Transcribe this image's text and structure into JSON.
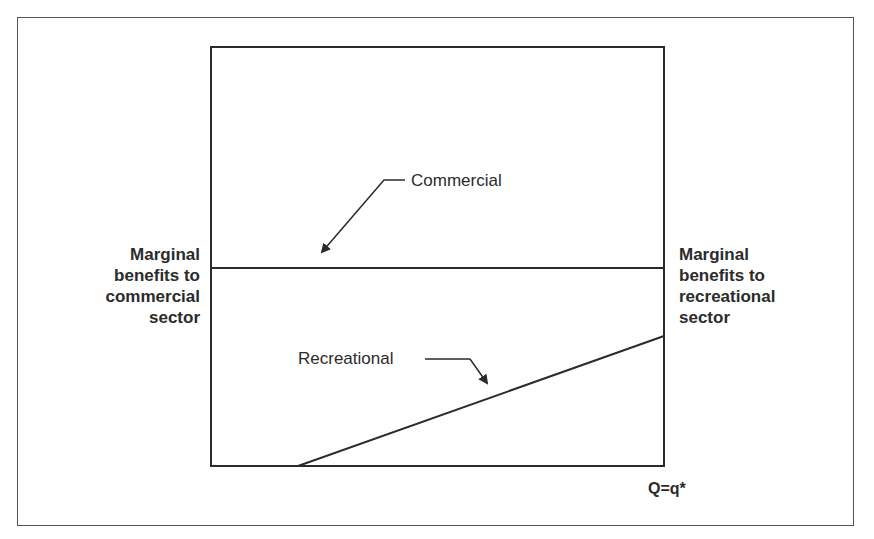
{
  "diagram": {
    "left_axis_label": [
      "Marginal",
      "benefits to",
      "commercial",
      "sector"
    ],
    "right_axis_label": [
      "Marginal",
      "benefits to",
      "recreational",
      "sector"
    ],
    "x_axis_label": "Q=q*",
    "curves": [
      {
        "name": "Commercial",
        "shape": "horizontal",
        "level": 0.53
      },
      {
        "name": "Recreational",
        "shape": "rising",
        "start_x": 0.19,
        "end_y": 0.31
      }
    ],
    "annotations": {
      "commercial": "Commercial",
      "recreational": "Recreational"
    },
    "line_color": "#2b2b2b"
  }
}
